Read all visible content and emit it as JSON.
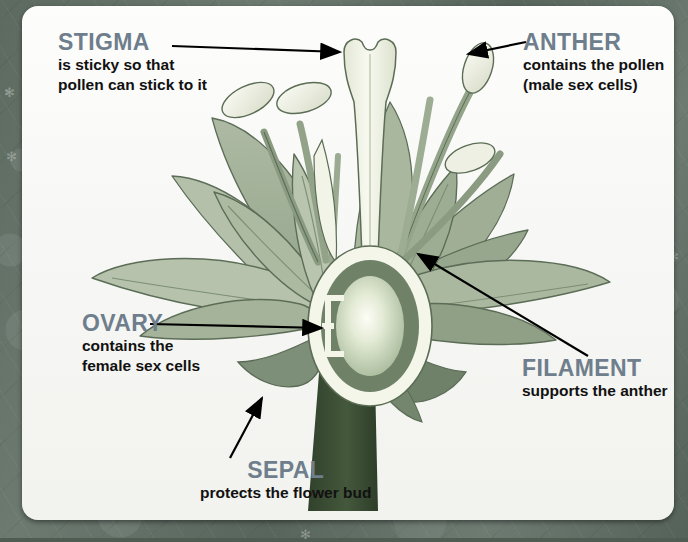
{
  "diagram": {
    "colors": {
      "heading": "#6e7e8c",
      "body_text": "#111111",
      "petal_light": "#b9c5ae",
      "petal_mid": "#9aab91",
      "petal_dark": "#7e9078",
      "sepal": "#7b8d76",
      "stem": "#3f5238",
      "style_pale": "#eef0e6",
      "ovary_ring_dark": "#6f8268",
      "ovary_core": "#cfd9c0",
      "anther": "#e9eadf",
      "outline": "#5a6b55",
      "card_background": "#fbfbf9",
      "page_background": "#5d6a60"
    },
    "labels": [
      {
        "id": "stigma",
        "title": "STIGMA",
        "description": [
          "is sticky so that",
          "pollen can stick to it"
        ],
        "align": "left",
        "arrow": "points right to the top of the style"
      },
      {
        "id": "anther",
        "title": "ANTHER",
        "description": [
          "contains the pollen",
          "(male sex cells)"
        ],
        "align": "left",
        "arrow": "points left to the upper right anther"
      },
      {
        "id": "ovary",
        "title": "OVARY",
        "description": [
          "contains the",
          "female sex cells"
        ],
        "align": "left",
        "arrow": "points right into the ovary centre"
      },
      {
        "id": "filament",
        "title": "FILAMENT",
        "description": [
          "supports the anther"
        ],
        "align": "left",
        "arrow": "points up-left to a filament stalk"
      },
      {
        "id": "sepal",
        "title": "SEPAL",
        "description": [
          "protects the flower bud"
        ],
        "align": "center",
        "arrow": "points up-right to the left sepal"
      }
    ],
    "parts": [
      "stigma",
      "style",
      "ovary",
      "anther",
      "filament",
      "petal",
      "sepal",
      "stem"
    ]
  }
}
